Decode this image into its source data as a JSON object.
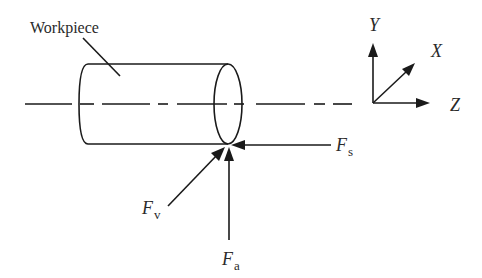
{
  "diagram": {
    "workpiece_label": "Workpiece",
    "axes": {
      "y_label": "Y",
      "x_label": "X",
      "z_label": "Z"
    },
    "forces": {
      "fs": {
        "symbol": "F",
        "subscript": "s",
        "direction": "toward -Z (axial, from right)"
      },
      "fv": {
        "symbol": "F",
        "subscript": "v",
        "direction": "diagonal, up-right"
      },
      "fa": {
        "symbol": "F",
        "subscript": "a",
        "direction": "upward (+Y)"
      }
    },
    "colors": {
      "line": "#1a1a1a",
      "text": "#2a2a2a",
      "background": "#ffffff"
    }
  }
}
